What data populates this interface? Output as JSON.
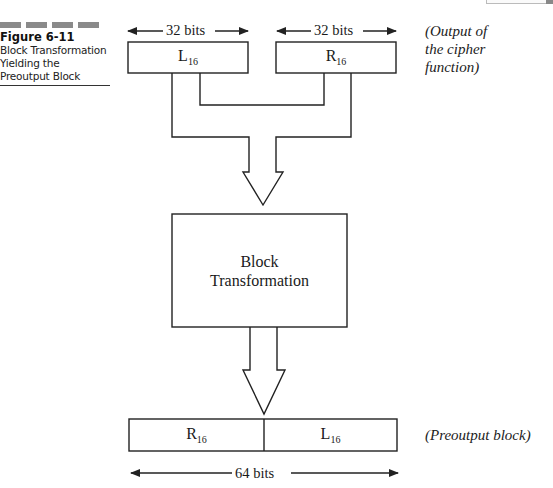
{
  "figure": {
    "number": "Figure 6-11",
    "title": "Block Transformation Yielding the Preoutput Block"
  },
  "diagram": {
    "input_blocks": [
      {
        "name": "L",
        "subscript": "16",
        "width_label": "32 bits"
      },
      {
        "name": "R",
        "subscript": "16",
        "width_label": "32 bits"
      }
    ],
    "input_note": "(Output of the cipher function)",
    "input_note_lines": [
      "(Output of",
      "the cipher",
      "function)"
    ],
    "process": {
      "line1": "Block",
      "line2": "Transformation"
    },
    "output_block": {
      "segments": [
        {
          "name": "R",
          "subscript": "16"
        },
        {
          "name": "L",
          "subscript": "16"
        }
      ],
      "width_label": "64 bits",
      "note": "(Preoutput block)"
    },
    "colors": {
      "stroke": "#222222",
      "caption_bar": "#8a8a8a"
    }
  }
}
